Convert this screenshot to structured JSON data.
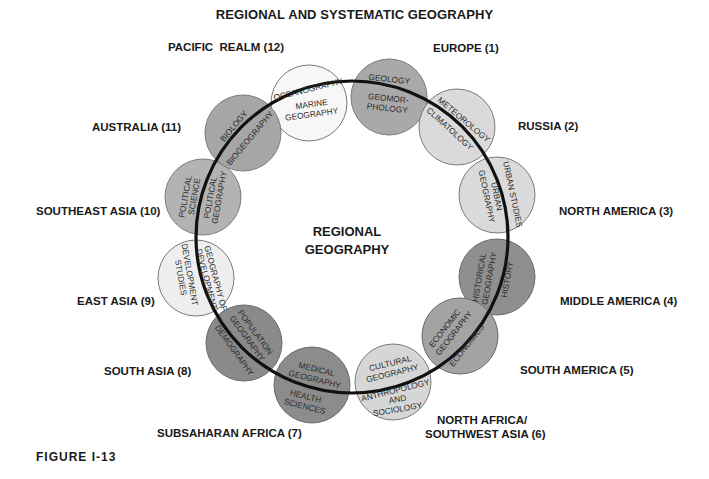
{
  "title": "REGIONAL AND SYSTEMATIC GEOGRAPHY",
  "figure_label": "FIGURE I-13",
  "center": {
    "line1": "REGIONAL",
    "line2": "GEOGRAPHY"
  },
  "regions": [
    {
      "id": 1,
      "label": "EUROPE (1)"
    },
    {
      "id": 2,
      "label": "RUSSIA (2)"
    },
    {
      "id": 3,
      "label": "NORTH AMERICA (3)"
    },
    {
      "id": 4,
      "label": "MIDDLE AMERICA (4)"
    },
    {
      "id": 5,
      "label": "SOUTH AMERICA (5)"
    },
    {
      "id": 6,
      "label_line1": "NORTH AFRICA/",
      "label_line2": "SOUTHWEST ASIA (6)"
    },
    {
      "id": 7,
      "label": "SUBSAHARAN AFRICA (7)"
    },
    {
      "id": 8,
      "label": "SOUTH ASIA (8)"
    },
    {
      "id": 9,
      "label": "EAST ASIA (9)"
    },
    {
      "id": 10,
      "label": "SOUTHEAST ASIA (10)"
    },
    {
      "id": 11,
      "label": "AUSTRALIA (11)"
    },
    {
      "id": 12,
      "label": "PACIFIC  REALM (12)"
    }
  ],
  "circles": [
    {
      "outer": "OCEANOGRAPHY",
      "inner": [
        "MARINE",
        "GEOGRAPHY"
      ],
      "fill": "#f7f7f7"
    },
    {
      "outer": "GEOLOGY",
      "inner": [
        "GEOMOR-",
        "PHOLOGY"
      ],
      "fill": "#a9a9a9"
    },
    {
      "outer": "METEOROLOGY",
      "inner": [
        "CLIMATOLOGY"
      ],
      "fill": "#dadada"
    },
    {
      "outer": "URBAN STUDIES",
      "inner": [
        "URBAN",
        "GEOGRAPHY"
      ],
      "fill": "#dadada"
    },
    {
      "outer": "HISTORY",
      "inner": [
        "HISTORICAL",
        "GEOGRAPHY"
      ],
      "fill": "#8f8f8f"
    },
    {
      "outer": "ECONOMICS",
      "inner": [
        "ECONOMIC",
        "GEOGRAPHY"
      ],
      "fill": "#a3a3a3"
    },
    {
      "outer": [
        "ANTHROPOLOGY",
        "AND",
        "SOCIOLOGY"
      ],
      "inner": [
        "CULTURAL",
        "GEOGRAPHY"
      ],
      "fill": "#d6d6d6"
    },
    {
      "outer": [
        "HEALTH",
        "SCIENCES"
      ],
      "inner": [
        "MEDICAL",
        "GEOGRAPHY"
      ],
      "fill": "#8c8c8c"
    },
    {
      "outer": "DEMOGRAPHY",
      "inner": [
        "POPULATION",
        "GEOGRAPHY"
      ],
      "fill": "#8a8a8a"
    },
    {
      "outer": [
        "DEVELOPMENT",
        "STUDIES"
      ],
      "inner": [
        "GEOGRAPHY OF",
        "DEVELOPMENT"
      ],
      "fill": "#eeeeee"
    },
    {
      "outer": [
        "POLITICAL",
        "SCIENCE"
      ],
      "inner": [
        "POLITICAL",
        "GEOGRAPHY"
      ],
      "fill": "#b3b3b3"
    },
    {
      "outer": "BIOLOGY",
      "inner": [
        "BIOGEOGRAPHY"
      ],
      "fill": "#a6a6a6"
    }
  ],
  "colors": {
    "ring": "#111111",
    "circle_stroke": "#7a7a7a",
    "text": "#1a1a1a"
  }
}
